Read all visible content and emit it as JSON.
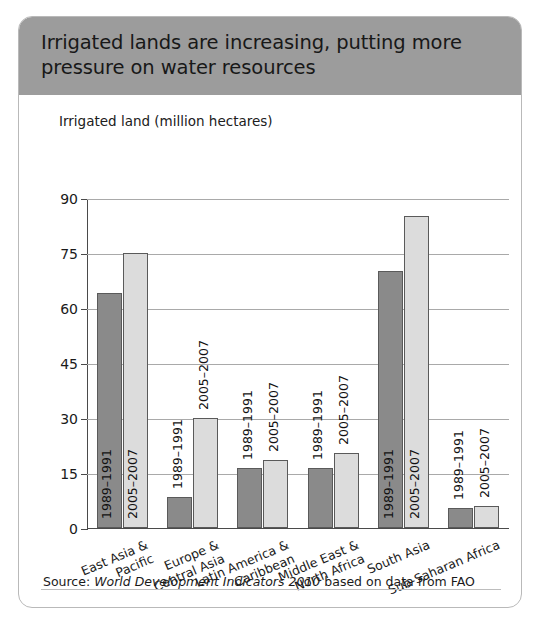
{
  "panel": {
    "title": "Irrigated lands are increasing, putting more pressure on water resources",
    "subtitle": "Irrigated land (million hectares)",
    "source_prefix": "Source: ",
    "source_italic": "World Development Indicators 2010",
    "source_suffix": " based on data from FAO",
    "header_bg": "#9c9c9c",
    "series1_color": "#8a8a8a",
    "series2_color": "#dcdcdc"
  },
  "chart_data": {
    "type": "bar",
    "title": "Irrigated lands are increasing, putting more pressure on water resources",
    "subtitle": "Irrigated land (million hectares)",
    "xlabel": "",
    "ylabel": "Irrigated land (million hectares)",
    "ylim": [
      0,
      90
    ],
    "yticks": [
      0,
      15,
      30,
      45,
      60,
      75,
      90
    ],
    "ytick_labels": [
      "0",
      "15",
      "30",
      "45",
      "60",
      "75",
      "90"
    ],
    "grid": true,
    "legend": "none (bars labeled in-place)",
    "categories": [
      "East Asia &\nPacific",
      "Europe &\nCentral Asia",
      "Latin America &\nCaribbean",
      "Middle East &\nNorth Africa",
      "South Asia",
      "Sub-Saharan Africa"
    ],
    "series": [
      {
        "name": "1989–1991",
        "color": "#8a8a8a",
        "values": [
          64,
          8.5,
          16.5,
          16.5,
          70,
          5.5
        ]
      },
      {
        "name": "2005–2007",
        "color": "#dcdcdc",
        "values": [
          75,
          30,
          18.5,
          20.5,
          85,
          6
        ]
      }
    ],
    "bar_labels": [
      "1989–1991",
      "2005–2007"
    ],
    "source": "Source: World Development Indicators 2010 based on data from FAO"
  }
}
